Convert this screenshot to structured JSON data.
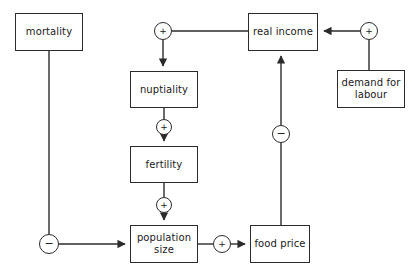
{
  "diagram": {
    "background_color": "#ffffff",
    "line_color": "#2b2b2b",
    "text_color": "#1a1a1a",
    "width": 419,
    "height": 277,
    "nodes": [
      {
        "id": "mortality",
        "label": "mortality",
        "x": 15,
        "y": 13,
        "w": 68,
        "h": 38
      },
      {
        "id": "nuptiality",
        "label": "nuptiality",
        "x": 130,
        "y": 71,
        "w": 68,
        "h": 37
      },
      {
        "id": "fertility",
        "label": "fertility",
        "x": 130,
        "y": 146,
        "w": 68,
        "h": 37
      },
      {
        "id": "population",
        "label": "population\nsize",
        "x": 130,
        "y": 225,
        "w": 68,
        "h": 38
      },
      {
        "id": "realincome",
        "label": "real income",
        "x": 248,
        "y": 13,
        "w": 70,
        "h": 38
      },
      {
        "id": "demand",
        "label": "demand for\nlabour",
        "x": 337,
        "y": 70,
        "w": 68,
        "h": 38
      },
      {
        "id": "foodprice",
        "label": "food price",
        "x": 250,
        "y": 225,
        "w": 60,
        "h": 38
      }
    ],
    "signs": [
      {
        "id": "sign-realincome-nuptiality",
        "symbol": "+",
        "polarity": "positive",
        "cx": 163,
        "cy": 31,
        "r": 9
      },
      {
        "id": "sign-nuptiality-fertility",
        "symbol": "+",
        "polarity": "positive",
        "cx": 164,
        "cy": 127,
        "r": 8
      },
      {
        "id": "sign-fertility-population",
        "symbol": "+",
        "polarity": "positive",
        "cx": 164,
        "cy": 205,
        "r": 8
      },
      {
        "id": "sign-mortality-population",
        "symbol": "−",
        "polarity": "negative",
        "cx": 49,
        "cy": 244,
        "r": 10
      },
      {
        "id": "sign-population-foodprice",
        "symbol": "+",
        "polarity": "positive",
        "cx": 222,
        "cy": 244,
        "r": 9
      },
      {
        "id": "sign-foodprice-realincome",
        "symbol": "−",
        "polarity": "negative",
        "cx": 281,
        "cy": 134,
        "r": 9
      },
      {
        "id": "sign-demand-realincome",
        "symbol": "+",
        "polarity": "positive",
        "cx": 369,
        "cy": 31,
        "r": 9
      }
    ],
    "edges": [
      {
        "id": "edge-realincome-to-sign-plus-nuptiality",
        "from": "realincome",
        "to": "sign-realincome-nuptiality",
        "arrow": false
      },
      {
        "id": "edge-sign-to-nuptiality",
        "from": "sign-realincome-nuptiality",
        "to": "nuptiality",
        "arrow": true
      },
      {
        "id": "edge-nuptiality-to-sign",
        "from": "nuptiality",
        "to": "sign-nuptiality-fertility",
        "arrow": false
      },
      {
        "id": "edge-sign-to-fertility",
        "from": "sign-nuptiality-fertility",
        "to": "fertility",
        "arrow": true
      },
      {
        "id": "edge-fertility-to-sign",
        "from": "fertility",
        "to": "sign-fertility-population",
        "arrow": false
      },
      {
        "id": "edge-sign-to-population",
        "from": "sign-fertility-population",
        "to": "population",
        "arrow": true
      },
      {
        "id": "edge-mortality-to-sign",
        "from": "mortality",
        "to": "sign-mortality-population",
        "arrow": false
      },
      {
        "id": "edge-sign-to-population-minus",
        "from": "sign-mortality-population",
        "to": "population",
        "arrow": true
      },
      {
        "id": "edge-population-to-sign",
        "from": "population",
        "to": "sign-population-foodprice",
        "arrow": false
      },
      {
        "id": "edge-sign-to-foodprice",
        "from": "sign-population-foodprice",
        "to": "foodprice",
        "arrow": true
      },
      {
        "id": "edge-foodprice-to-sign-minus",
        "from": "foodprice",
        "to": "sign-foodprice-realincome",
        "arrow": false
      },
      {
        "id": "edge-sign-minus-to-realincome",
        "from": "sign-foodprice-realincome",
        "to": "realincome",
        "arrow": true
      },
      {
        "id": "edge-demand-to-sign",
        "from": "demand",
        "to": "sign-demand-realincome",
        "arrow": false
      },
      {
        "id": "edge-sign-to-realincome",
        "from": "sign-demand-realincome",
        "to": "realincome",
        "arrow": true
      }
    ]
  }
}
